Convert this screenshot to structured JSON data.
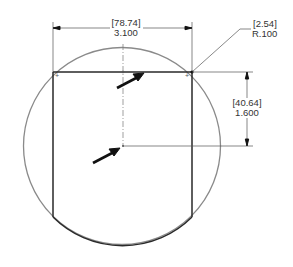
{
  "drawing": {
    "type": "engineering-drawing",
    "description": "Square with rounded corners inscribed in a circle, with dimension annotations",
    "colors": {
      "outline": "#2a2a2a",
      "circle": "#8a8a8a",
      "dimension_lines": "#555555",
      "arrows": "#111111"
    },
    "dimensions": {
      "width": {
        "metric": "[78.74]",
        "imperial": "3.100"
      },
      "corner_radius": {
        "metric": "[2.54]",
        "imperial": "R.100"
      },
      "height_to_center": {
        "metric": "[40.64]",
        "imperial": "1.600"
      }
    },
    "callouts": [
      {
        "name": "arrow-to-top-edge"
      },
      {
        "name": "arrow-to-center"
      }
    ]
  }
}
